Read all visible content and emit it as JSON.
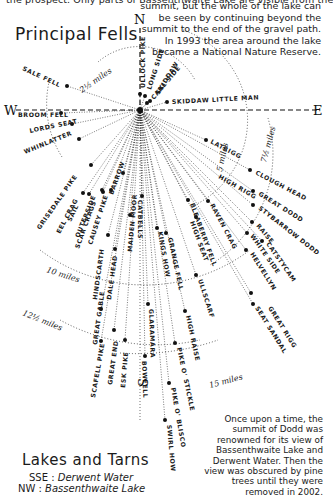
{
  "header": {
    "cut_text": "the prospect. Only parts of Bassenthwaite Lake are visible from the",
    "note": "summit, but the whole of the lake can be seen by continuing beyond the summit to the end of the gravel path. In 1993 the area around the lake became a National Nature Reserve."
  },
  "diagram": {
    "title": "Principal Fells",
    "compass": {
      "north": "N",
      "south": "S",
      "east": "E",
      "west": "W"
    },
    "distance_rings": [
      {
        "label": "2½ miles"
      },
      {
        "label": "5 miles"
      },
      {
        "label": "7½ miles"
      },
      {
        "label": "10 miles"
      },
      {
        "label": "12½ miles"
      },
      {
        "label": "15 miles"
      }
    ],
    "fells": [
      "Ullock Pike",
      "Long Side",
      "Skiddaw",
      "Carl Side",
      "Skiddaw Little Man",
      "Sale Fell",
      "Broom Fell",
      "Lords Seat",
      "Whinlatter",
      "Latrigg",
      "Clough Head",
      "High Rigg",
      "Great Dodd",
      "Stybarrow Dodd",
      "Raise",
      "Catstycam",
      "White Side",
      "Helvellyn",
      "Seat Sandal",
      "Great Rigg",
      "Grisedale Pike",
      "Eel Crag",
      "Sail",
      "Outerside",
      "Scar Crags",
      "Causey Pike",
      "Barrow",
      "Catbells",
      "Maiden Moor",
      "Hindscarth",
      "Dale Head",
      "Great Gable",
      "Great End",
      "Esk Pike",
      "Scafell Pike",
      "Kings How",
      "Grange Fell",
      "Bleaberry Fell",
      "High Seat",
      "Raven Crag",
      "Ullscarf",
      "High Raise",
      "Glaramara",
      "Bowfell",
      "Pike o' Stickle",
      "Pike o' Blisco",
      "Swirl How"
    ]
  },
  "lakes": {
    "title": "Lakes and Tarns",
    "items": [
      {
        "direction": "SSE :",
        "name": "Derwent Water"
      },
      {
        "direction": "NW :",
        "name": "Bassenthwaite Lake"
      }
    ]
  },
  "footer_note": "Once upon a time, the summit of Dodd was renowned for its view of Bassenthwaite Lake and Derwent Water. Then the view was obscured by pine trees until they were removed in 2002."
}
